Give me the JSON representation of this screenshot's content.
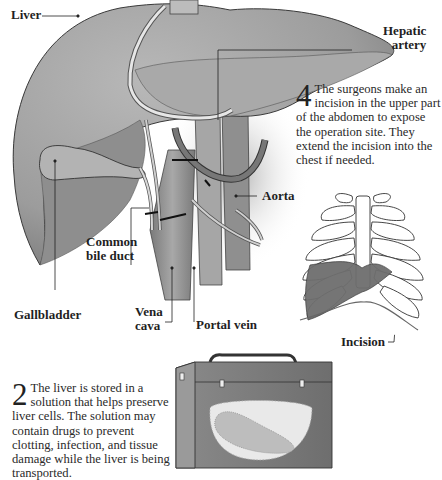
{
  "labels": {
    "liver": "Liver",
    "hepatic_artery_line1": "Hepatic",
    "hepatic_artery_line2": "artery",
    "aorta": "Aorta",
    "common_bile_duct_line1": "Common",
    "common_bile_duct_line2": "bile duct",
    "gallbladder": "Gallbladder",
    "vena_cava_line1": "Vena",
    "vena_cava_line2": "cava",
    "portal_vein": "Portal vein",
    "incision": "Incision"
  },
  "steps": [
    {
      "number": "4",
      "text": "The surgeons make an incision in the upper part of the abdomen to expose the operation site. They extend the incision into the chest if needed."
    },
    {
      "number": "2",
      "text": "The liver is stored in a solution that helps preserve liver cells. The solution may contain drugs to prevent clotting, infection, and tissue damage while the liver is being transported."
    }
  ],
  "colors": {
    "liver_fill": "#9a9a9a",
    "liver_light": "#bdbdbd",
    "vessel_fill": "#8a8a8a",
    "ribs_outline": "#333333",
    "organ_dark": "#6b6b6b",
    "case_fill": "#7c7c7c"
  }
}
